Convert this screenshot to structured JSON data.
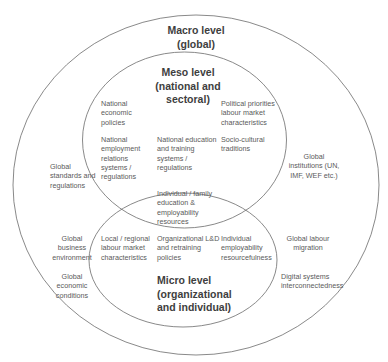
{
  "diagram": {
    "type": "nested-ellipse (venn) diagram",
    "line_color": "#6b6b6b",
    "levels": {
      "macro": {
        "title": "Macro level\n(global)"
      },
      "meso": {
        "title": "Meso level\n(national and\nsectoral)"
      },
      "micro": {
        "title": "Micro level\n(organizational\nand individual)"
      }
    },
    "meso_items": {
      "national_economic_policies": "National\neconomic\npolicies",
      "political_priorities": "Political priorities\nlabour market\ncharacteristics",
      "national_employment_relations": "National\nemployment\nrelations\nsystems /\nregulations",
      "national_education": "National education\nand training\nsystems /\nregulations",
      "socio_cultural": "Socio-cultural\ntraditions"
    },
    "overlap_items": {
      "individual_family": "Individual / family\neducation &\nemployability\nresources"
    },
    "micro_items": {
      "local_regional": "Local / regional\nlabour market\ncharacteristics",
      "organizational_ld": "Organizational L&D\nand retraining\npolicies",
      "individual_employability": "Individual\nemployability\nresourcefulness"
    },
    "macro_items": {
      "global_standards": "Global\nstandards and\nregulations",
      "global_institutions": "Global\ninstitutions (UN,\nIMF, WEF etc.)",
      "global_business": "Global\nbusiness\nenvironment",
      "global_labour_migration": "Global labour\nmigration",
      "global_economic": "Global\neconomic\nconditions",
      "digital_systems": "Digital systems\ninterconnectedness"
    }
  }
}
